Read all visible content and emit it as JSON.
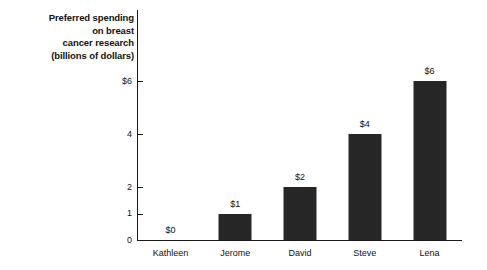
{
  "chart_data": {
    "type": "bar",
    "title": "",
    "xlabel": "",
    "ylabel": "Preferred spending on breast cancer research (billions of dollars)",
    "ylabel_lines": [
      "Preferred spending",
      "on breast",
      "cancer research",
      "(billions of dollars)"
    ],
    "categories": [
      "Kathleen",
      "Jerome",
      "David",
      "Steve",
      "Lena"
    ],
    "values": [
      0,
      1,
      2,
      4,
      6
    ],
    "value_labels": [
      "$0",
      "$1",
      "$2",
      "$4",
      "$6"
    ],
    "ytick_values": [
      0,
      1,
      2,
      4,
      6
    ],
    "ytick_labels": [
      "0",
      "1",
      "2",
      "4",
      "$6"
    ],
    "ylim": [
      0,
      6.3
    ],
    "grid": false,
    "legend": null,
    "bar_color": "#262626",
    "axis_color": "#1a1a1a",
    "text_color": "#111111",
    "background": "#ffffff"
  }
}
